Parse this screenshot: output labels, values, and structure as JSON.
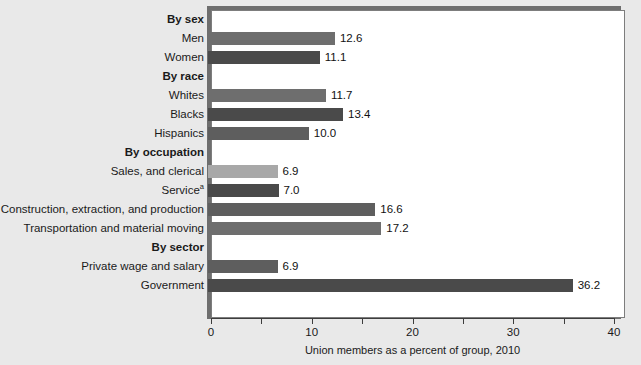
{
  "chart_data": {
    "type": "bar",
    "orientation": "horizontal",
    "title": "",
    "xlabel": "Union members as a percent of group, 2010",
    "ylabel": "",
    "xlim": [
      0,
      40
    ],
    "xticks": [
      0,
      5,
      10,
      15,
      20,
      25,
      30,
      35,
      40
    ],
    "xtick_labels": [
      "0",
      "",
      "10",
      "",
      "20",
      "",
      "30",
      "",
      "40"
    ],
    "grid": false,
    "legend": null,
    "footnote_marker": "a",
    "groups": [
      {
        "heading": "By sex",
        "rows": [
          {
            "label": "Men",
            "value": 12.6,
            "value_label": "12.6",
            "color": "#6e6e6e"
          },
          {
            "label": "Women",
            "value": 11.1,
            "value_label": "11.1",
            "color": "#4a4a4a"
          }
        ]
      },
      {
        "heading": "By race",
        "rows": [
          {
            "label": "Whites",
            "value": 11.7,
            "value_label": "11.7",
            "color": "#6e6e6e"
          },
          {
            "label": "Blacks",
            "value": 13.4,
            "value_label": "13.4",
            "color": "#4a4a4a"
          },
          {
            "label": "Hispanics",
            "value": 10.0,
            "value_label": "10.0",
            "color": "#5e5e5e"
          }
        ]
      },
      {
        "heading": "By occupation",
        "rows": [
          {
            "label": "Sales, and clerical",
            "value": 6.9,
            "value_label": "6.9",
            "color": "#a8a8a8"
          },
          {
            "label": "Service",
            "superscript": "a",
            "value": 7.0,
            "value_label": "7.0",
            "color": "#4a4a4a"
          },
          {
            "label": "Construction, extraction, and production",
            "value": 16.6,
            "value_label": "16.6",
            "color": "#5e5e5e"
          },
          {
            "label": "Transportation and material moving",
            "value": 17.2,
            "value_label": "17.2",
            "color": "#6e6e6e"
          }
        ]
      },
      {
        "heading": "By sector",
        "rows": [
          {
            "label": "Private wage and salary",
            "value": 6.9,
            "value_label": "6.9",
            "color": "#5e5e5e"
          },
          {
            "label": "Government",
            "value": 36.2,
            "value_label": "36.2",
            "color": "#4a4a4a"
          }
        ]
      }
    ]
  },
  "colors": {
    "background": "#e9e9e9",
    "panel": "#ffffff",
    "panel_border": "#7d7d7d",
    "shadow": "#6e6e6e",
    "axis": "#3d3d3d",
    "text": "#1a1a1a"
  }
}
